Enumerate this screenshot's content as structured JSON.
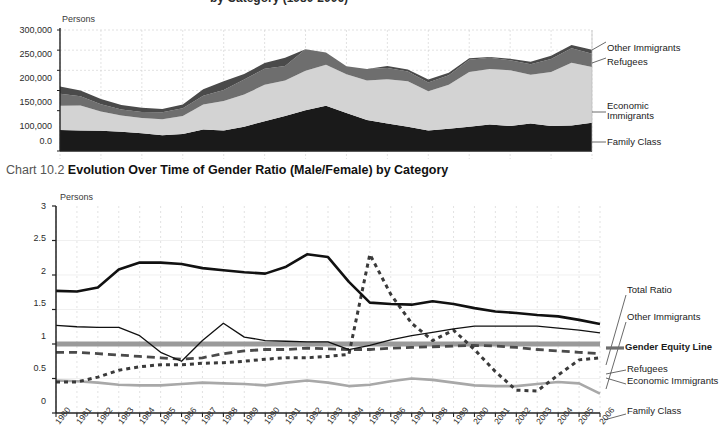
{
  "top_partial_title": "by Category (1980-2006)",
  "chart1": {
    "persons_label": "Persons",
    "ytick_labels": [
      "300,000",
      "250,000",
      "200,000",
      "150,000",
      "100,000",
      "0.0"
    ],
    "series_labels": {
      "other_immigrants": "Other Immigrants",
      "refugees": "Refugees",
      "economic_immigrants_l1": "Economic",
      "economic_immigrants_l2": "Immigrants",
      "family_class": "Family Class"
    }
  },
  "chart2": {
    "figure_number": "Chart 10.2",
    "title": "Evolution Over Time of Gender Ratio (Male/Female) by Category",
    "persons_label": "Persons",
    "ytick_labels": [
      "3",
      "2.5",
      "2",
      "1.5",
      "1",
      "0.5",
      "0"
    ],
    "series_labels": {
      "total_ratio": "Total Ratio",
      "other_immigrants": "Other Immigrants",
      "gender_equity_line": "Gender Equity Line",
      "refugees": "Refugees",
      "economic_immigrants": "Economic Immigrants",
      "family_class": "Family Class"
    }
  },
  "colors": {
    "family_class": "#1a1a1a",
    "economic_immigrants": "#d3d3d3",
    "refugees": "#6e6e6e",
    "other_immigrants": "#4a4a4a",
    "gender_equity_line": "#9a9a9a",
    "total_ratio": "#111111",
    "grid": "#cfcfcf",
    "axis": "#222222"
  },
  "chart_data": [
    {
      "type": "area",
      "title": "Immigration by Category (1980-2006)",
      "stacked": true,
      "xlabel": "",
      "ylabel": "Persons",
      "ylim": [
        0,
        300000
      ],
      "yticks": [
        0,
        100000,
        150000,
        200000,
        250000,
        300000
      ],
      "grid": true,
      "legend_position": "right",
      "x": [
        1980,
        1981,
        1982,
        1983,
        1984,
        1985,
        1986,
        1987,
        1988,
        1989,
        1990,
        1991,
        1992,
        1993,
        1994,
        1995,
        1996,
        1997,
        1998,
        1999,
        2000,
        2001,
        2002,
        2003,
        2004,
        2005,
        2006
      ],
      "series": [
        {
          "name": "Family Class",
          "values": [
            52000,
            51000,
            50000,
            48000,
            44000,
            39000,
            42000,
            53000,
            51000,
            60000,
            74000,
            87000,
            101000,
            112000,
            94000,
            77000,
            68000,
            60000,
            51000,
            55000,
            60000,
            66000,
            62000,
            68000,
            62000,
            63000,
            70000
          ]
        },
        {
          "name": "Economic Immigrants",
          "values": [
            60000,
            62000,
            48000,
            40000,
            38000,
            40000,
            45000,
            62000,
            73000,
            80000,
            90000,
            88000,
            98000,
            102000,
            96000,
            98000,
            110000,
            113000,
            97000,
            109000,
            136000,
            137000,
            138000,
            121000,
            134000,
            156000,
            138000
          ]
        },
        {
          "name": "Refugees",
          "values": [
            30000,
            23000,
            18000,
            15000,
            15000,
            17000,
            19000,
            22000,
            27000,
            37000,
            40000,
            36000,
            53000,
            30000,
            20000,
            28000,
            28000,
            24000,
            22000,
            24000,
            30000,
            28000,
            25000,
            26000,
            32000,
            36000,
            33000
          ]
        },
        {
          "name": "Other Immigrants",
          "values": [
            18000,
            14000,
            13000,
            11000,
            10000,
            8000,
            9000,
            16000,
            22000,
            14000,
            14000,
            20000,
            0,
            0,
            0,
            0,
            5000,
            5000,
            7000,
            6000,
            4000,
            2000,
            4000,
            6000,
            8000,
            8000,
            10000
          ]
        }
      ]
    },
    {
      "type": "line",
      "title": "Evolution Over Time of Gender Ratio (Male/Female) by Category",
      "xlabel": "",
      "ylabel": "Persons",
      "ylim": [
        0,
        3
      ],
      "yticks": [
        0,
        0.5,
        1,
        1.5,
        2,
        2.5,
        3
      ],
      "grid": true,
      "legend_position": "right",
      "x": [
        1980,
        1981,
        1982,
        1983,
        1984,
        1985,
        1986,
        1987,
        1988,
        1989,
        1990,
        1991,
        1992,
        1993,
        1994,
        1995,
        1996,
        1997,
        1998,
        1999,
        2000,
        2001,
        2002,
        2003,
        2004,
        2005,
        2006
      ],
      "series": [
        {
          "name": "Total Ratio",
          "style": "solid-thick",
          "color": "#111111",
          "values": [
            1.77,
            1.76,
            1.82,
            2.08,
            2.18,
            2.18,
            2.16,
            2.1,
            2.07,
            2.04,
            2.02,
            2.12,
            2.3,
            2.26,
            1.9,
            1.6,
            1.58,
            1.57,
            1.62,
            1.58,
            1.52,
            1.47,
            1.45,
            1.42,
            1.4,
            1.35,
            1.29,
            1.22
          ]
        },
        {
          "name": "Other Immigrants",
          "style": "solid-thin",
          "color": "#111111",
          "values": [
            1.27,
            1.25,
            1.24,
            1.24,
            1.12,
            0.88,
            0.75,
            1.05,
            1.3,
            1.1,
            1.05,
            1.04,
            1.03,
            1.03,
            0.92,
            0.98,
            1.06,
            1.12,
            1.17,
            1.22,
            1.26,
            1.26,
            1.26,
            1.26,
            1.23,
            1.2,
            1.16
          ]
        },
        {
          "name": "Gender Equity Line",
          "style": "solid-band",
          "color": "#9a9a9a",
          "values": [
            1,
            1,
            1,
            1,
            1,
            1,
            1,
            1,
            1,
            1,
            1,
            1,
            1,
            1,
            1,
            1,
            1,
            1,
            1,
            1,
            1,
            1,
            1,
            1,
            1,
            1,
            1
          ]
        },
        {
          "name": "Refugees",
          "style": "dotted",
          "color": "#3a3a3a",
          "values": [
            0.45,
            0.45,
            0.52,
            0.62,
            0.67,
            0.7,
            0.7,
            0.72,
            0.73,
            0.75,
            0.78,
            0.8,
            0.8,
            0.82,
            0.85,
            2.3,
            1.72,
            1.3,
            1.05,
            1.2,
            0.92,
            0.6,
            0.33,
            0.32,
            0.55,
            0.77,
            0.8
          ]
        },
        {
          "name": "Economic Immigrants",
          "style": "dashed",
          "color": "#4a4a4a",
          "values": [
            0.88,
            0.88,
            0.86,
            0.84,
            0.82,
            0.8,
            0.78,
            0.8,
            0.86,
            0.9,
            0.92,
            0.92,
            0.94,
            0.93,
            0.92,
            0.92,
            0.94,
            0.95,
            0.96,
            0.97,
            0.98,
            0.97,
            0.95,
            0.92,
            0.9,
            0.88,
            0.86
          ]
        },
        {
          "name": "Family Class",
          "style": "solid-grey",
          "color": "#a8a8a8",
          "values": [
            0.47,
            0.46,
            0.44,
            0.41,
            0.4,
            0.4,
            0.42,
            0.44,
            0.43,
            0.42,
            0.4,
            0.44,
            0.47,
            0.44,
            0.39,
            0.41,
            0.46,
            0.5,
            0.48,
            0.44,
            0.4,
            0.39,
            0.39,
            0.42,
            0.45,
            0.43,
            0.28
          ]
        }
      ]
    }
  ]
}
